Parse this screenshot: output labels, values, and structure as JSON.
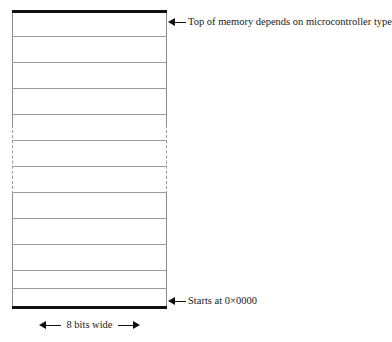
{
  "figure": {
    "name": "microcontroller-memory-map",
    "colors": {
      "border_heavy": "#111111",
      "rule_light": "#9b9b9b",
      "dashed_side": "#9a9a9a",
      "background": "#ffffff",
      "text": "#1a1a1a"
    },
    "memory_block": {
      "row_count": 11,
      "row_height_px": 26,
      "ellipsis_rows": [
        5,
        6
      ],
      "top_border_style": "thick-solid",
      "bottom_border_style": "thick-solid",
      "side_border_style": "thin-solid",
      "ellipsis_side_border_style": "dashed"
    },
    "annotations": {
      "top": {
        "icon": "arrow-left-icon",
        "label": "Top of memory depends on microcontroller type"
      },
      "bottom": {
        "icon": "arrow-left-icon",
        "label": "Starts at 0×0000"
      },
      "width_caption": {
        "left_icon": "arrow-left-icon",
        "right_icon": "arrow-right-icon",
        "label": "8 bits wide"
      }
    }
  }
}
